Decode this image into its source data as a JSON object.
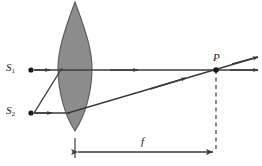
{
  "figure": {
    "caption": "",
    "background_color": "#ffffff",
    "line_color": "#3b3b3b",
    "lens_fill": "#8c8c8c",
    "lens_stroke": "#4a4a4a",
    "dash_color": "#3b3b3b"
  },
  "labels": {
    "source_1": {
      "text": "S",
      "subscript": "1"
    },
    "source_2": {
      "text": "S",
      "subscript": "2"
    },
    "image_point": {
      "text": "P",
      "subscript": ""
    },
    "focal_length": {
      "text": "f",
      "subscript": ""
    }
  },
  "geometry": {
    "optical_axis_y": 70,
    "lens_center_x": 75,
    "lens_half_width": 17,
    "lens_top_y": 2,
    "lens_bottom_y": 131,
    "source_1": {
      "x": 31,
      "y": 70
    },
    "source_2": {
      "x": 31,
      "y": 113
    },
    "image_point": {
      "x": 216,
      "y": 70
    },
    "dashed_line": {
      "x": 216,
      "y_top": 70,
      "y_bottom": 150
    },
    "dimension_line": {
      "x_start": 75,
      "x_end": 216,
      "y": 152
    },
    "ray_extension_end_x": 258
  },
  "elements": {
    "lens": "biconvex-lens",
    "axis": "optical-axis",
    "ray_s1": "ray-from-source-1",
    "ray_s2_axis": "ray-from-source-2-horizontal",
    "ray_s2_diag": "ray-from-source-2-through-lens-center",
    "focal_marker": "focal-length-dimension"
  }
}
